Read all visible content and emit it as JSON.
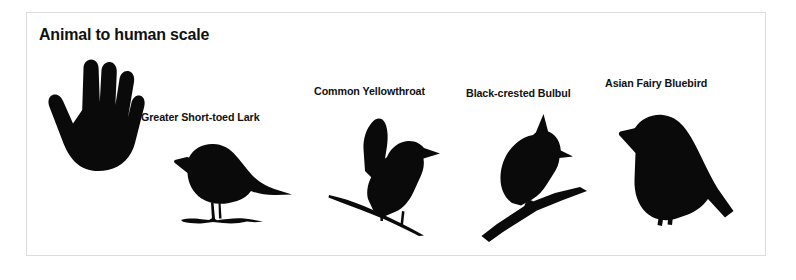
{
  "panel": {
    "title": "Animal to human scale",
    "background_color": "#ffffff",
    "border_color": "#dcdcdc",
    "silhouette_color": "#0a0a0a"
  },
  "figures": [
    {
      "id": "human-hand",
      "label": "",
      "icon": "human-hand-silhouette",
      "description": "Human hand, palm forward, four fingers up and thumb left"
    },
    {
      "id": "greater-short-toed-lark",
      "label": "Greater Short-toed Lark",
      "icon": "lark-silhouette",
      "description": "Perched songbird in left profile standing on ground"
    },
    {
      "id": "common-yellowthroat",
      "label": "Common Yellowthroat",
      "icon": "yellowthroat-silhouette",
      "description": "Bird with raised wings perched on a thin diagonal twig"
    },
    {
      "id": "black-crested-bulbul",
      "label": "Black-crested Bulbul",
      "icon": "bulbul-silhouette",
      "description": "Crested bird perched on a thick diagonal branch"
    },
    {
      "id": "asian-fairy-bluebird",
      "label": "Asian Fairy Bluebird",
      "icon": "bluebird-silhouette",
      "description": "Plump bird in left profile with long down-sloping tail"
    }
  ]
}
